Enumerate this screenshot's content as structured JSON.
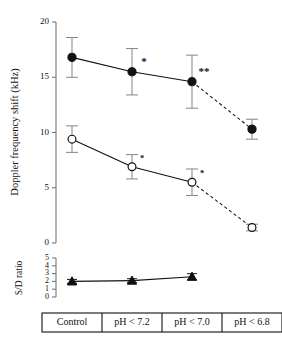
{
  "chart_data": {
    "type": "line",
    "title": "",
    "categories": [
      "Control",
      "pH < 7.2",
      "pH < 7.0",
      "pH < 6.8"
    ],
    "panels": [
      {
        "name": "doppler",
        "ylabel": "Doppler frequency shift (kHz)",
        "ylim": [
          0,
          20
        ],
        "yticks": [
          0,
          5,
          10,
          15,
          20
        ],
        "yticklabels": [
          "0",
          "5",
          "10",
          "15",
          "20"
        ],
        "grid": false,
        "series": [
          {
            "name": "filled-circle-series",
            "marker": "filled-circle",
            "values": [
              16.8,
              15.5,
              14.6,
              10.3
            ],
            "errors": [
              1.8,
              2.1,
              2.4,
              0.9
            ],
            "dashed_from_index": 2,
            "annotations": [
              "",
              "*",
              "**",
              ""
            ]
          },
          {
            "name": "open-circle-series",
            "marker": "open-circle",
            "values": [
              9.4,
              6.9,
              5.5,
              1.4
            ],
            "errors": [
              1.2,
              1.1,
              1.2,
              0.3
            ],
            "dashed_from_index": 2,
            "annotations": [
              "",
              "*",
              "*",
              ""
            ]
          }
        ]
      },
      {
        "name": "sd-ratio",
        "ylabel": "S/D ratio",
        "ylim": [
          0,
          5
        ],
        "yticks": [
          0,
          1,
          2,
          3,
          4,
          5
        ],
        "yticklabels": [
          "0",
          "1",
          "2",
          "3",
          "4",
          "5"
        ],
        "grid": false,
        "series": [
          {
            "name": "triangle-series",
            "marker": "filled-triangle",
            "values": [
              2.0,
              2.1,
              2.6,
              null
            ],
            "errors": [
              0.25,
              0.25,
              0.4,
              null
            ],
            "annotations": [
              "",
              "",
              "",
              ""
            ]
          }
        ]
      }
    ]
  }
}
